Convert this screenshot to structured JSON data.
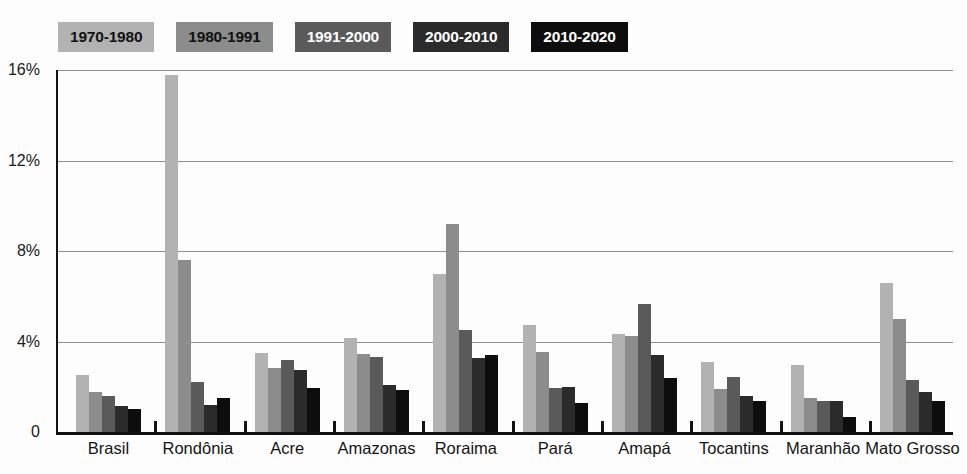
{
  "chart_data": {
    "type": "bar",
    "title": "",
    "subtitle": "",
    "xlabel": "",
    "ylabel": "",
    "ylim": [
      0,
      16
    ],
    "ytick_labels": [
      "0",
      "4%",
      "8%",
      "12%",
      "16%"
    ],
    "ytick_values": [
      0,
      4,
      8,
      12,
      16
    ],
    "grid": true,
    "legend_position": "top-left",
    "categories": [
      "Brasil",
      "Rondônia",
      "Acre",
      "Amazonas",
      "Roraima",
      "Pará",
      "Amapá",
      "Tocantins",
      "Maranhão",
      "Mato Grosso"
    ],
    "series": [
      {
        "name": "1970-1980",
        "color": "#b2b2b2",
        "text_color": "#111111",
        "values": [
          2.5,
          15.8,
          3.5,
          4.15,
          7.0,
          4.75,
          4.35,
          3.1,
          2.95,
          6.6
        ]
      },
      {
        "name": "1980-1991",
        "color": "#8c8c8c",
        "text_color": "#111111",
        "values": [
          1.75,
          7.6,
          2.85,
          3.45,
          9.2,
          3.55,
          4.25,
          1.9,
          1.5,
          5.0
        ]
      },
      {
        "name": "1991-2000",
        "color": "#5a5a5a",
        "text_color": "#ffffff",
        "values": [
          1.6,
          2.2,
          3.2,
          3.3,
          4.5,
          1.95,
          5.65,
          2.45,
          1.35,
          2.3
        ]
      },
      {
        "name": "2000-2010",
        "color": "#2b2b2b",
        "text_color": "#ffffff",
        "values": [
          1.15,
          1.2,
          2.75,
          2.1,
          3.25,
          2.0,
          3.4,
          1.6,
          1.35,
          1.75
        ]
      },
      {
        "name": "2010-2020",
        "color": "#0d0d0d",
        "text_color": "#ffffff",
        "values": [
          1.0,
          1.5,
          1.95,
          1.85,
          3.4,
          1.3,
          2.4,
          1.35,
          0.65,
          1.35
        ]
      }
    ]
  },
  "axis": {
    "y_max_label": "16%",
    "y_12_label": "12%",
    "y_8_label": "8%",
    "y_4_label": "4%",
    "y_0_label": "0"
  },
  "colors": {
    "axis": "#111111",
    "gridline": "#8f8f8f",
    "background": "#fdfdfd",
    "label_text": "#141414"
  }
}
